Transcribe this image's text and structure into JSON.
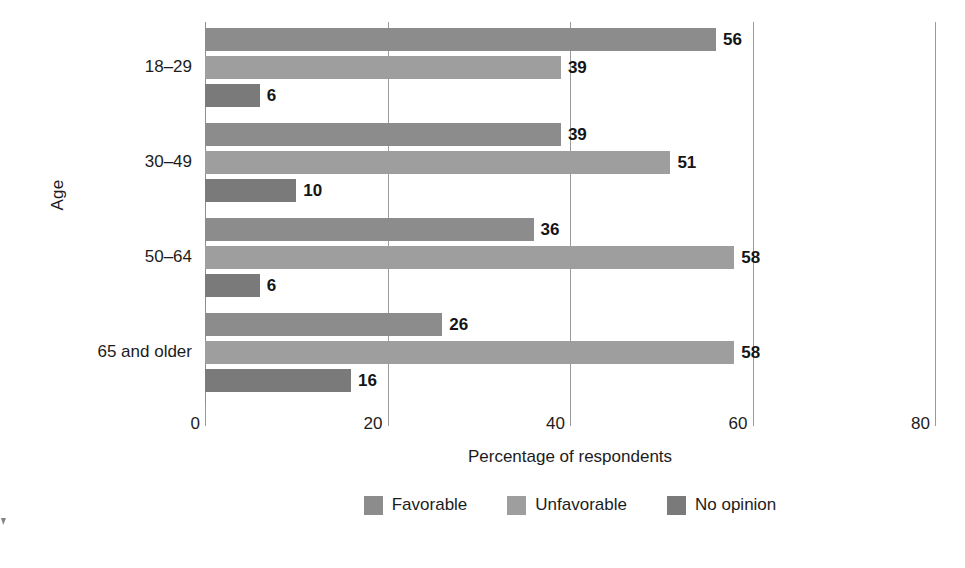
{
  "chart_data": {
    "type": "bar",
    "orientation": "horizontal",
    "title": "",
    "xlabel": "Percentage of respondents",
    "ylabel": "Age",
    "categories": [
      "18–29",
      "30–49",
      "50–64",
      "65 and older"
    ],
    "series": [
      {
        "name": "Favorable",
        "color": "#8c8c8c",
        "values": [
          56,
          39,
          36,
          26
        ]
      },
      {
        "name": "Unfavorable",
        "color": "#9e9e9e",
        "values": [
          39,
          51,
          58,
          58
        ]
      },
      {
        "name": "No opinion",
        "color": "#7a7a7a",
        "values": [
          6,
          10,
          6,
          16
        ]
      }
    ],
    "value_labels": [
      [
        "56",
        "39",
        "6"
      ],
      [
        "39",
        "51",
        "10"
      ],
      [
        "36",
        "58",
        "6"
      ],
      [
        "26",
        "58",
        "16"
      ]
    ],
    "xlim": [
      0,
      80
    ],
    "xticks": [
      0,
      20,
      40,
      60,
      80
    ],
    "xtick_labels": [
      "0",
      "20",
      "40",
      "60",
      "80"
    ],
    "grid": true,
    "grid_axis": "x",
    "legend_position": "bottom-center",
    "legend_entries": [
      "Favorable",
      "Unfavorable",
      "No opinion"
    ],
    "background": "#ffffff",
    "gridline_color": "#9a9a9a"
  }
}
